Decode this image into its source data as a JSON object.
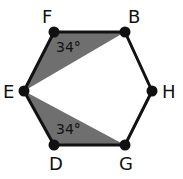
{
  "diagram": {
    "shape": "hexagon",
    "vertices": [
      {
        "name": "F",
        "label": "F"
      },
      {
        "name": "B",
        "label": "B"
      },
      {
        "name": "H",
        "label": "H"
      },
      {
        "name": "G",
        "label": "G"
      },
      {
        "name": "D",
        "label": "D"
      },
      {
        "name": "E",
        "label": "E"
      }
    ],
    "shaded_triangles": [
      {
        "vertices": [
          "F",
          "B",
          "E"
        ],
        "angle_label": "34°"
      },
      {
        "vertices": [
          "D",
          "G",
          "E"
        ],
        "angle_label": "34°"
      }
    ],
    "colors": {
      "shade": "#6f6f6f",
      "stroke": "#111111"
    }
  }
}
